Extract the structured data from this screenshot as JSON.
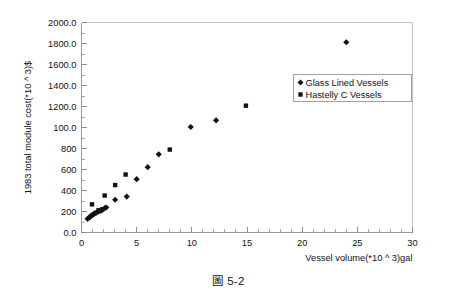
{
  "figure": {
    "caption_symbol": "圖",
    "caption_number": "5-2"
  },
  "chart_data": {
    "type": "scatter",
    "title": "",
    "xlabel": "Vessel volume(*10 ^ 3)gal",
    "ylabel": "1983 total module cost(*10 ^ 3)$",
    "xlim": [
      0,
      30
    ],
    "ylim": [
      0,
      2000
    ],
    "xticks": [
      0,
      5,
      10,
      15,
      20,
      25,
      30
    ],
    "xtick_labels": [
      "0",
      "5",
      "10",
      "15",
      "20",
      "25",
      "30"
    ],
    "yticks": [
      0,
      200,
      400,
      600,
      800,
      1000,
      1200,
      1400,
      1600,
      1800,
      2000
    ],
    "ytick_labels": [
      "0.0",
      "200",
      "400",
      "600",
      "800",
      "100.0",
      "1200.0",
      "1400.0",
      "1600.0",
      "1800.0",
      "2000.0"
    ],
    "x_minor_tick_interval": 1,
    "y_minor_tick_interval": 100,
    "grid": false,
    "legend_position": "upper right",
    "series": [
      {
        "name": "Glass Lined Vessels",
        "marker": "diamond",
        "color": "#131313",
        "points": [
          [
            0.55,
            130
          ],
          [
            0.7,
            145
          ],
          [
            0.8,
            152
          ],
          [
            0.9,
            160
          ],
          [
            1.0,
            168
          ],
          [
            1.1,
            175
          ],
          [
            1.2,
            182
          ],
          [
            1.35,
            190
          ],
          [
            1.5,
            198
          ],
          [
            1.7,
            205
          ],
          [
            1.85,
            212
          ],
          [
            2.1,
            232
          ],
          [
            2.25,
            238
          ],
          [
            3.05,
            312
          ],
          [
            4.1,
            342
          ],
          [
            5.0,
            508
          ],
          [
            6.0,
            622
          ],
          [
            7.0,
            745
          ],
          [
            9.9,
            1005
          ],
          [
            12.2,
            1068
          ],
          [
            24.0,
            1812
          ]
        ]
      },
      {
        "name": "Hastelly C Vessels",
        "marker": "square",
        "color": "#131313",
        "points": [
          [
            0.95,
            268
          ],
          [
            1.55,
            212
          ],
          [
            1.9,
            222
          ],
          [
            2.1,
            352
          ],
          [
            3.05,
            452
          ],
          [
            4.0,
            552
          ],
          [
            8.0,
            790
          ],
          [
            14.9,
            1208
          ]
        ]
      }
    ]
  }
}
